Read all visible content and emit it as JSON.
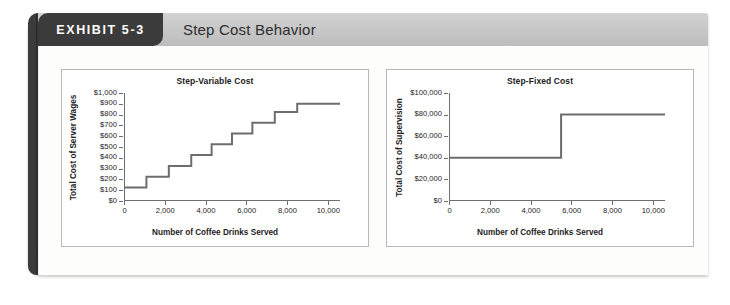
{
  "exhibit": {
    "tab_label": "EXHIBIT 5-3",
    "title": "Step Cost Behavior"
  },
  "colors": {
    "tab_background": "#3b3b3b",
    "header_bar": "#c6c6c6",
    "line": "#6d6d6d",
    "axis": "#6f6f6f",
    "panel_border": "#b9b9b9",
    "card_background": "#fdfdfc"
  },
  "chart_data": [
    {
      "type": "line",
      "id": "step-variable-cost",
      "title": "Step-Variable Cost",
      "xlabel": "Number of Coffee Drinks Served",
      "ylabel": "Total Cost of Server Wages",
      "xlim": [
        0,
        10600
      ],
      "ylim": [
        0,
        1000
      ],
      "grid": false,
      "legend": null,
      "x_ticks": [
        0,
        2000,
        4000,
        6000,
        8000,
        10000
      ],
      "x_tick_labels": [
        "0",
        "2,000",
        "4,000",
        "6,000",
        "8,000",
        "10,000"
      ],
      "y_ticks": [
        0,
        100,
        200,
        300,
        400,
        500,
        600,
        700,
        800,
        900,
        1000
      ],
      "y_tick_labels": [
        "$0",
        "$100",
        "$200",
        "$300",
        "$400",
        "$500",
        "$600",
        "$700",
        "$800",
        "$900",
        "$1,000"
      ],
      "step_style": "post",
      "steps": [
        {
          "x_start": 0,
          "x_end": 1100,
          "y": 125
        },
        {
          "x_start": 1100,
          "x_end": 2200,
          "y": 225
        },
        {
          "x_start": 2200,
          "x_end": 3300,
          "y": 325
        },
        {
          "x_start": 3300,
          "x_end": 4300,
          "y": 425
        },
        {
          "x_start": 4300,
          "x_end": 5300,
          "y": 525
        },
        {
          "x_start": 5300,
          "x_end": 6300,
          "y": 625
        },
        {
          "x_start": 6300,
          "x_end": 7400,
          "y": 725
        },
        {
          "x_start": 7400,
          "x_end": 8500,
          "y": 825
        },
        {
          "x_start": 8500,
          "x_end": 10600,
          "y": 900
        }
      ]
    },
    {
      "type": "line",
      "id": "step-fixed-cost",
      "title": "Step-Fixed Cost",
      "xlabel": "Number of Coffee Drinks Served",
      "ylabel": "Total Cost of Supervision",
      "xlim": [
        0,
        10600
      ],
      "ylim": [
        0,
        100000
      ],
      "grid": false,
      "legend": null,
      "x_ticks": [
        0,
        2000,
        4000,
        6000,
        8000,
        10000
      ],
      "x_tick_labels": [
        "0",
        "2,000",
        "4,000",
        "6,000",
        "8,000",
        "10,000"
      ],
      "y_ticks": [
        0,
        20000,
        40000,
        60000,
        80000,
        100000
      ],
      "y_tick_labels": [
        "$0",
        "$20,000",
        "$40,000",
        "$60,000",
        "$80,000",
        "$100,000"
      ],
      "step_style": "post",
      "steps": [
        {
          "x_start": 0,
          "x_end": 5500,
          "y": 40000
        },
        {
          "x_start": 5500,
          "x_end": 10600,
          "y": 80000
        }
      ]
    }
  ]
}
